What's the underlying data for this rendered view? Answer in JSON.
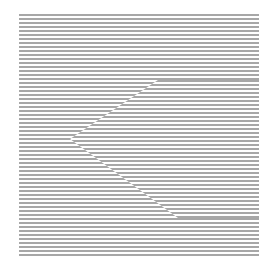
{
  "figure": {
    "type": "illusory-contour-line-grating",
    "background_color": "#ffffff",
    "line_color": "#8a8a8a",
    "grating": {
      "x0": 19,
      "y0": 15,
      "x1": 259,
      "y1": 258,
      "period": 4,
      "line_width": 1.6
    },
    "shifted_region": {
      "shape": "wedge",
      "phase_shift": 2,
      "top_edge_start": [
        158,
        80
      ],
      "tip": [
        70,
        139
      ],
      "bottom_edge_end": [
        178,
        218
      ]
    }
  }
}
